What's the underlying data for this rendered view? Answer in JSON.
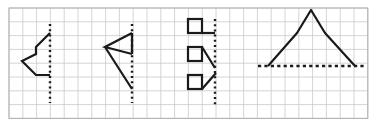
{
  "figure": {
    "canvas": {
      "width": 375,
      "height": 126,
      "background": "#ffffff"
    },
    "grid": {
      "origin_x": 9,
      "origin_y": 8,
      "cell": 13.8,
      "cols": 26,
      "rows": 8,
      "line_color": "#c9c9c9",
      "border_color": "#b0b0b0",
      "show": true
    },
    "style": {
      "stroke_color": "#1a1a1a",
      "stroke_width": 2.2,
      "dash_color": "#1a1a1a",
      "dash_pattern": "2,3.2",
      "dash_width": 2.4
    },
    "shapes": [
      {
        "name": "arrow-chevron-figure",
        "kind": "polyline",
        "points": "50,33 36,47 36,54 22,61 36,75 50,75",
        "mirror_line": {
          "orientation": "vertical",
          "x": 50,
          "y1": 24,
          "y2": 103
        }
      },
      {
        "name": "flag-triangle-figure",
        "kind": "polyline",
        "points": "132,33 105,47 132,54 105,47 132,33 105,47 132,89",
        "segments": [
          "105,47 132,33",
          "105,47 132,54",
          "105,47 132,89",
          "132,33 132,54"
        ],
        "mirror_line": {
          "orientation": "vertical",
          "x": 132,
          "y1": 24,
          "y2": 103
        }
      },
      {
        "name": "three-squares-figure",
        "kind": "group",
        "squares": [
          {
            "x": 188,
            "y": 19,
            "size": 14,
            "tail": "horizontal",
            "tail_to": "215,33"
          },
          {
            "x": 188,
            "y": 47,
            "size": 14,
            "tail": "diagonal-down",
            "tail_to": "215,68"
          },
          {
            "x": 188,
            "y": 75,
            "size": 14,
            "tail": "diagonal-up",
            "tail_to": "215,75"
          }
        ],
        "mirror_line": {
          "orientation": "vertical",
          "x": 215,
          "y1": 19,
          "y2": 106
        }
      },
      {
        "name": "mountain-peak-figure",
        "kind": "polyline",
        "points": "268,66 297,33 311,10 325,33 355,66",
        "mirror_line": {
          "orientation": "horizontal",
          "y": 66,
          "x1": 258,
          "x2": 364
        }
      }
    ],
    "labels": {
      "figure_1": "Figure 1",
      "figure_2": "Figure 2",
      "figure_3": "Figure 3",
      "figure_4": "Figure 4"
    }
  }
}
